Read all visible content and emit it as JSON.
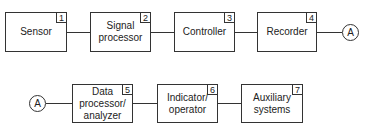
{
  "diagram": {
    "row1": {
      "blocks": [
        {
          "label": "Sensor",
          "number": "1"
        },
        {
          "label": "Signal\nprocessor",
          "number": "2"
        },
        {
          "label": "Controller",
          "number": "3"
        },
        {
          "label": "Recorder",
          "number": "4"
        }
      ],
      "connector": "A"
    },
    "row2": {
      "connector": "A",
      "blocks": [
        {
          "label": "Data\nprocessor/\nanalyzer",
          "number": "5"
        },
        {
          "label": "Indicator/\noperator",
          "number": "6"
        },
        {
          "label": "Auxiliary\nsystems",
          "number": "7"
        }
      ]
    }
  }
}
